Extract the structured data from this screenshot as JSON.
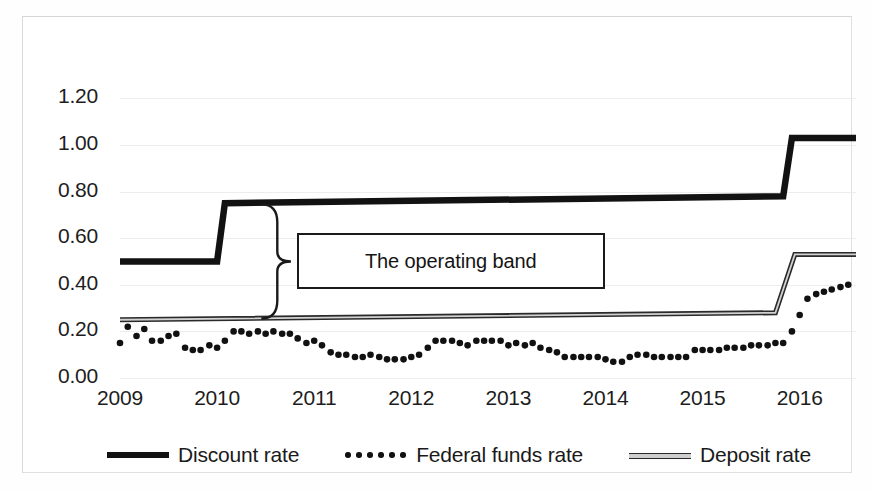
{
  "chart_data": {
    "type": "line",
    "title": "",
    "xlabel": "",
    "ylabel": "",
    "xlim": [
      2009.0,
      2016.58
    ],
    "ylim": [
      0.0,
      1.3
    ],
    "grid": true,
    "legend_position": "bottom",
    "y_ticks": [
      "0.00",
      "0.20",
      "0.40",
      "0.60",
      "0.80",
      "1.00",
      "1.20"
    ],
    "y_tick_values": [
      0.0,
      0.2,
      0.4,
      0.6,
      0.8,
      1.0,
      1.2
    ],
    "x_ticks": [
      "2009",
      "2010",
      "2011",
      "2012",
      "2013",
      "2014",
      "2015",
      "2016"
    ],
    "x_tick_values": [
      2009,
      2010,
      2011,
      2012,
      2013,
      2014,
      2015,
      2016
    ],
    "annotations": [
      {
        "text": "The operating band",
        "type": "boxed-label-with-brace"
      }
    ],
    "series": [
      {
        "name": "Discount rate",
        "style": "thick-step-line",
        "color": "#121212",
        "x": [
          2009.0,
          2010.0,
          2010.08,
          2015.83,
          2015.92,
          2016.58
        ],
        "values": [
          0.5,
          0.5,
          0.75,
          0.78,
          1.03,
          1.03
        ]
      },
      {
        "name": "Deposit rate",
        "style": "thin-double-line",
        "color": "#2a2a2a",
        "x": [
          2009.0,
          2015.75,
          2015.95,
          2016.58
        ],
        "values": [
          0.25,
          0.28,
          0.53,
          0.53
        ]
      },
      {
        "name": "Federal funds rate",
        "style": "dotted",
        "color": "#111111",
        "x": [
          2009.0,
          2009.08,
          2009.17,
          2009.25,
          2009.33,
          2009.42,
          2009.5,
          2009.58,
          2009.67,
          2009.75,
          2009.83,
          2009.92,
          2010.0,
          2010.08,
          2010.17,
          2010.25,
          2010.33,
          2010.42,
          2010.5,
          2010.58,
          2010.67,
          2010.75,
          2010.83,
          2010.92,
          2011.0,
          2011.08,
          2011.17,
          2011.25,
          2011.33,
          2011.42,
          2011.5,
          2011.58,
          2011.67,
          2011.75,
          2011.83,
          2011.92,
          2012.0,
          2012.08,
          2012.17,
          2012.25,
          2012.33,
          2012.42,
          2012.5,
          2012.58,
          2012.67,
          2012.75,
          2012.83,
          2012.92,
          2013.0,
          2013.08,
          2013.17,
          2013.25,
          2013.33,
          2013.42,
          2013.5,
          2013.58,
          2013.67,
          2013.75,
          2013.83,
          2013.92,
          2014.0,
          2014.08,
          2014.17,
          2014.25,
          2014.33,
          2014.42,
          2014.5,
          2014.58,
          2014.67,
          2014.75,
          2014.83,
          2014.92,
          2015.0,
          2015.08,
          2015.17,
          2015.25,
          2015.33,
          2015.42,
          2015.5,
          2015.58,
          2015.67,
          2015.75,
          2015.83,
          2015.92,
          2016.0,
          2016.08,
          2016.17,
          2016.25,
          2016.33,
          2016.42,
          2016.5
        ],
        "values": [
          0.15,
          0.22,
          0.18,
          0.21,
          0.16,
          0.16,
          0.18,
          0.19,
          0.13,
          0.12,
          0.12,
          0.14,
          0.13,
          0.16,
          0.2,
          0.2,
          0.19,
          0.2,
          0.19,
          0.2,
          0.19,
          0.19,
          0.17,
          0.15,
          0.16,
          0.14,
          0.11,
          0.1,
          0.1,
          0.09,
          0.09,
          0.1,
          0.09,
          0.08,
          0.08,
          0.08,
          0.09,
          0.1,
          0.13,
          0.16,
          0.16,
          0.16,
          0.15,
          0.14,
          0.16,
          0.16,
          0.16,
          0.16,
          0.14,
          0.15,
          0.14,
          0.15,
          0.13,
          0.12,
          0.11,
          0.09,
          0.09,
          0.09,
          0.09,
          0.09,
          0.08,
          0.07,
          0.07,
          0.09,
          0.1,
          0.1,
          0.09,
          0.09,
          0.09,
          0.09,
          0.09,
          0.12,
          0.12,
          0.12,
          0.12,
          0.13,
          0.13,
          0.13,
          0.14,
          0.14,
          0.14,
          0.15,
          0.15,
          0.2,
          0.27,
          0.34,
          0.36,
          0.37,
          0.38,
          0.39,
          0.4
        ]
      }
    ]
  },
  "legend": {
    "items": [
      {
        "label": "Discount rate",
        "swatch": "thick-line-swatch"
      },
      {
        "label": "Federal funds rate",
        "swatch": "dotted-line-swatch"
      },
      {
        "label": "Deposit rate",
        "swatch": "thin-line-swatch"
      }
    ]
  },
  "annotation": {
    "operating_band_label": "The operating band"
  }
}
